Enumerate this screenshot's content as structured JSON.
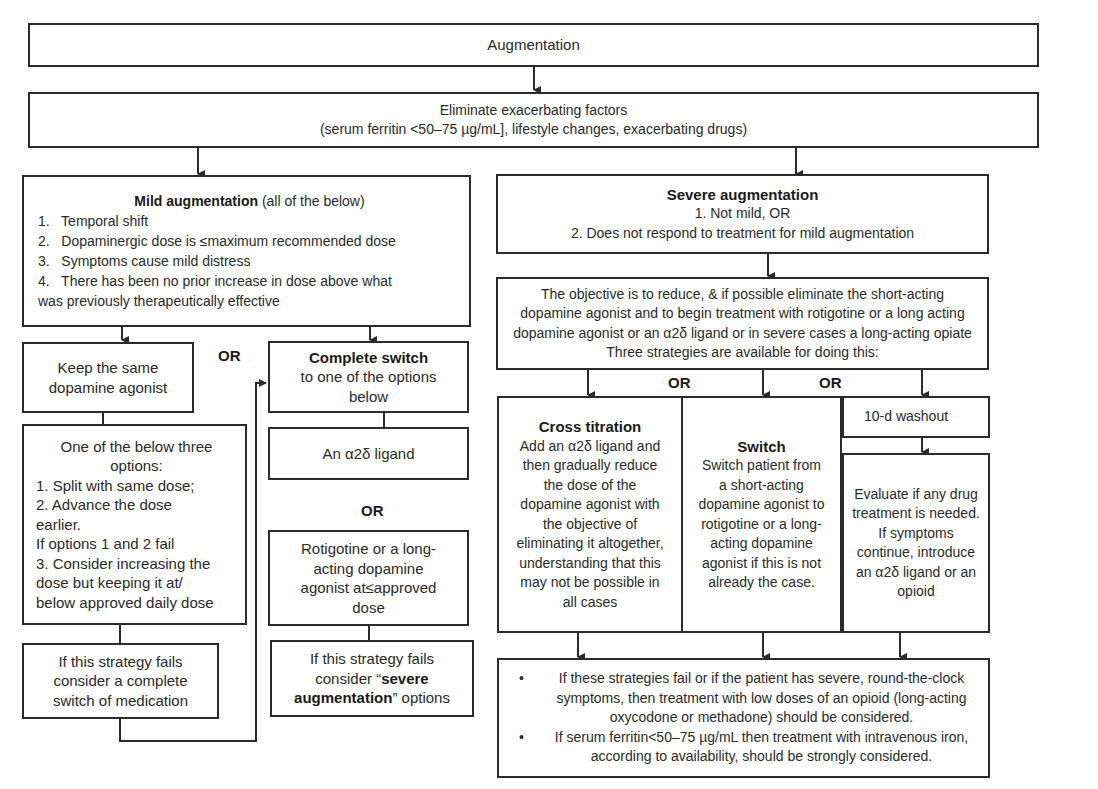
{
  "title": "Augmentation",
  "eliminate": {
    "line1": "Eliminate exacerbating factors",
    "line2": "(serum ferritin <50–75 µg/mL], lifestyle changes, exacerbating drugs)"
  },
  "mild": {
    "heading_bold": "Mild augmentation",
    "heading_rest": " (all of the below)",
    "items": [
      "1.   Temporal shift",
      "2.   Dopaminergic dose is ≤maximum recommended dose",
      "3.   Symptoms cause mild distress",
      "4.   There has been no prior increase in dose above what",
      "was previously therapeutically effective"
    ]
  },
  "keep_same": {
    "line1": "Keep the same",
    "line2": "dopamine agonist"
  },
  "one_of_three": {
    "heading1": "One of the below three",
    "heading2": "options:",
    "lines": [
      "1. Split with same dose;",
      "2. Advance the dose",
      "earlier.",
      "If options 1 and 2 fail",
      "3. Consider increasing the",
      "dose but keeping it at/",
      "below approved daily dose"
    ]
  },
  "strategy_fails_left": {
    "lines": [
      "If this strategy fails",
      "consider a complete",
      "switch of medication"
    ]
  },
  "complete_switch": {
    "heading": "Complete switch",
    "line1": "to one of the options",
    "line2": "below"
  },
  "alpha_ligand": {
    "label": "An α2δ ligand"
  },
  "rotigotine": {
    "lines": [
      "Rotigotine or a long-",
      "acting dopamine",
      "agonist at≤approved",
      "dose"
    ]
  },
  "strategy_fails_mid": {
    "line1": "If this strategy fails",
    "line2_pre": "consider “",
    "line2_bold": "severe",
    "line3_bold": "augmentation",
    "line3_post": "” options"
  },
  "or_labels": {
    "or1": "OR",
    "or2": "OR",
    "or3": "OR",
    "or4": "OR"
  },
  "severe": {
    "heading": "Severe augmentation",
    "line1": "1. Not mild, OR",
    "line2": "2. Does not respond to treatment for mild augmentation"
  },
  "objective": {
    "lines": [
      "The objective is to reduce, & if possible eliminate the short-acting",
      "dopamine agonist and to begin treatment with rotigotine or a long acting",
      "dopamine agonist or an α2δ ligand or in severe cases a long-acting opiate",
      "Three strategies are available for doing this:"
    ]
  },
  "cross_titration": {
    "heading": "Cross titration",
    "lines": [
      "Add an α2δ ligand and",
      "then gradually reduce",
      "the dose of the",
      "dopamine agonist with",
      "the objective of",
      "eliminating it altogether,",
      "understanding that this",
      "may not be possible in",
      "all cases"
    ]
  },
  "switch": {
    "heading": "Switch",
    "lines": [
      "Switch patient from",
      "a short-acting",
      "dopamine agonist to",
      "rotigotine or a long-",
      "acting dopamine",
      "agonist if this is not",
      "already the case."
    ]
  },
  "washout": {
    "label": "10-d washout"
  },
  "evaluate": {
    "lines": [
      "Evaluate if any drug",
      "treatment is needed.",
      "If symptoms",
      "continue, introduce",
      "an α2δ ligand or an",
      "opioid"
    ]
  },
  "final": {
    "bullets": [
      "If these strategies fail or if the patient has severe, round-the-clock symptoms, then treatment with low doses of an opioid (long-acting oxycodone or methadone) should be considered.",
      "If serum ferritin<50–75 µg/mL then treatment with intravenous iron, according to availability, should be strongly considered."
    ]
  },
  "colors": {
    "line": "#2b2b2b",
    "text": "#2a2a2a",
    "background": "#ffffff"
  }
}
